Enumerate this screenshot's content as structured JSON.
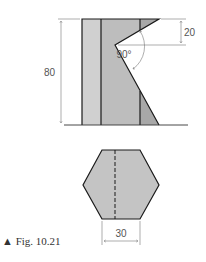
{
  "figure": {
    "caption": "▲ Fig. 10.21",
    "front_view": {
      "dimension_height": "80",
      "dimension_notch": "20",
      "angle_label": "90°"
    },
    "top_view": {
      "dimension_width": "30"
    },
    "colors": {
      "fill_light": "#d0d0d0",
      "fill_mid": "#bdbdbd",
      "fill_dark": "#a8a8a8",
      "outline": "#1a1a1a",
      "dim_line": "#777777"
    }
  }
}
